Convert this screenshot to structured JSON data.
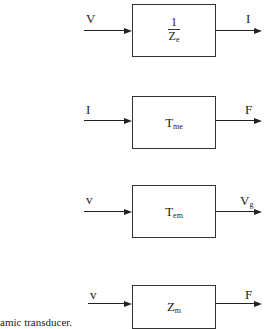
{
  "blocks": [
    {
      "input": "V",
      "output": "I",
      "main": "Z",
      "sub": "e",
      "numerator": "1",
      "fraction": true
    },
    {
      "input": "I",
      "output": "F",
      "main": "T",
      "sub": "me",
      "fraction": false
    },
    {
      "input": "v",
      "output": "V",
      "output_sub": "g",
      "main": "T",
      "sub": "em",
      "fraction": false
    },
    {
      "input": "v",
      "output": "F",
      "main": "Z",
      "sub": "m",
      "fraction": false
    }
  ],
  "caption": "amic transducer."
}
